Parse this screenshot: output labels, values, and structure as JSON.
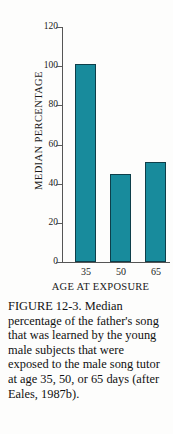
{
  "figure": {
    "caption_label": "FIGURE 12-3.",
    "caption_text": " Median percentage of the father's song that was learned by the young male subjects that were exposed to the male song tutor at age 35, 50, or 65 days (after Eales, 1987b).",
    "caption_full": "FIGURE 12-3. Median percentage of the father's song that was learned by the young male subjects that were exposed to the male song tutor at age 35, 50, or 65 days (after Eales, 1987b)."
  },
  "chart_data": {
    "type": "bar",
    "title": "",
    "categories": [
      "35",
      "50",
      "65"
    ],
    "values": [
      101,
      45,
      51
    ],
    "xlabel": "AGE AT EXPOSURE",
    "ylabel": "MEDIAN PERCENTAGE",
    "ylim": [
      0,
      120
    ],
    "yticks": [
      0,
      20,
      40,
      60,
      80,
      100,
      120
    ],
    "ytick_labels": [
      "0",
      "20",
      "40",
      "60",
      "80",
      "100",
      "120"
    ],
    "grid": false,
    "legend": false,
    "legend_position": "none",
    "bar_color": "#188b9c",
    "bar_edge_color": "#0e3f4a",
    "axis_color": "#555555",
    "background": "#fdfdfc"
  }
}
